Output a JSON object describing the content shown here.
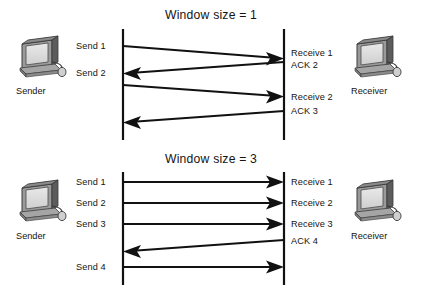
{
  "figure": {
    "type": "sequence-diagram",
    "background_color": "#ffffff",
    "line_color": "#111111"
  },
  "panels": [
    {
      "id": "window-size-1",
      "title": "Window size = 1",
      "sender": {
        "label": "Sender",
        "icon": "computer-icon"
      },
      "receiver": {
        "label": "Receiver",
        "icon": "computer-icon"
      },
      "left_labels": [
        {
          "text": "Send 1"
        },
        {
          "text": "Send 2"
        }
      ],
      "right_labels": [
        {
          "text": "Receive 1"
        },
        {
          "text": "ACK 2"
        },
        {
          "text": "Receive 2"
        },
        {
          "text": "ACK 3"
        }
      ],
      "messages": [
        {
          "text": "Send 1",
          "direction": "right",
          "slanted": true
        },
        {
          "text": "ACK 2",
          "direction": "left",
          "slanted": true
        },
        {
          "text": "Send 2",
          "direction": "right",
          "slanted": true
        },
        {
          "text": "ACK 3",
          "direction": "left",
          "slanted": true
        }
      ]
    },
    {
      "id": "window-size-3",
      "title": "Window size = 3",
      "sender": {
        "label": "Sender",
        "icon": "computer-icon"
      },
      "receiver": {
        "label": "Receiver",
        "icon": "computer-icon"
      },
      "left_labels": [
        {
          "text": "Send 1"
        },
        {
          "text": "Send 2"
        },
        {
          "text": "Send 3"
        },
        {
          "text": "Send 4"
        }
      ],
      "right_labels": [
        {
          "text": "Receive 1"
        },
        {
          "text": "Receive 2"
        },
        {
          "text": "Receive 3"
        },
        {
          "text": "ACK 4"
        }
      ],
      "messages": [
        {
          "text": "Send 1",
          "direction": "right",
          "slanted": false
        },
        {
          "text": "Send 2",
          "direction": "right",
          "slanted": false
        },
        {
          "text": "Send 3",
          "direction": "right",
          "slanted": false
        },
        {
          "text": "ACK 4",
          "direction": "left",
          "slanted": true
        },
        {
          "text": "Send 4",
          "direction": "right",
          "slanted": false
        }
      ]
    }
  ]
}
